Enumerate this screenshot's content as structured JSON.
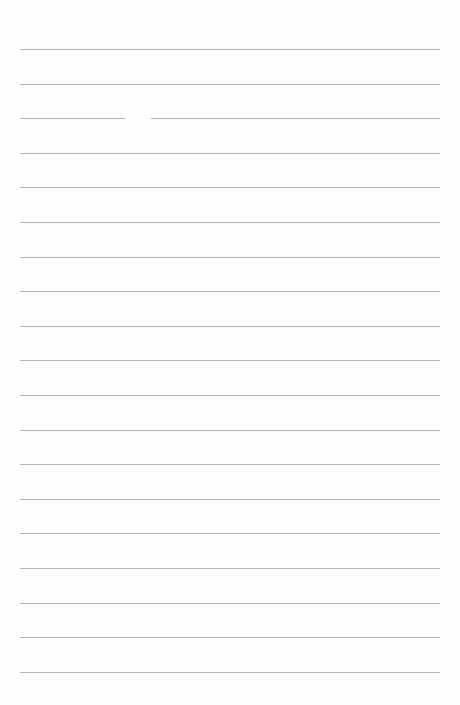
{
  "document": {
    "type": "blank lined paper",
    "line_count": 19,
    "first_line_y": 49,
    "line_spacing": 34.6,
    "line_color": "#a8a8a8",
    "background_color": "#fefefe",
    "text": ""
  }
}
